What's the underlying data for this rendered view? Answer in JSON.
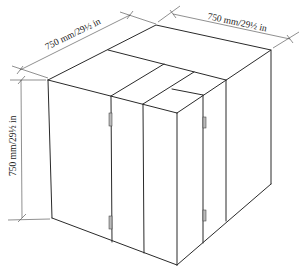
{
  "diagram": {
    "dimensions": {
      "top_left": "750 mm/29½ in",
      "top_right": "750 mm/29½ in",
      "height": "750 mm/29½ in"
    },
    "colors": {
      "line": "#2a2a2a",
      "background": "#ffffff"
    }
  }
}
